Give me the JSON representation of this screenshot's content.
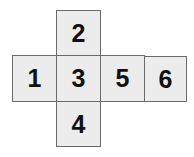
{
  "net": {
    "cells": [
      {
        "label": "2",
        "x": 56,
        "y": 10,
        "w": 45,
        "h": 46
      },
      {
        "label": "1",
        "x": 12,
        "y": 55,
        "w": 45,
        "h": 47
      },
      {
        "label": "3",
        "x": 56,
        "y": 55,
        "w": 45,
        "h": 47
      },
      {
        "label": "5",
        "x": 100,
        "y": 55,
        "w": 45,
        "h": 47
      },
      {
        "label": "6",
        "x": 144,
        "y": 56,
        "w": 43,
        "h": 46
      },
      {
        "label": "4",
        "x": 56,
        "y": 101,
        "w": 45,
        "h": 46
      }
    ],
    "fill": "#ececec",
    "border": "#6a6a6a"
  }
}
